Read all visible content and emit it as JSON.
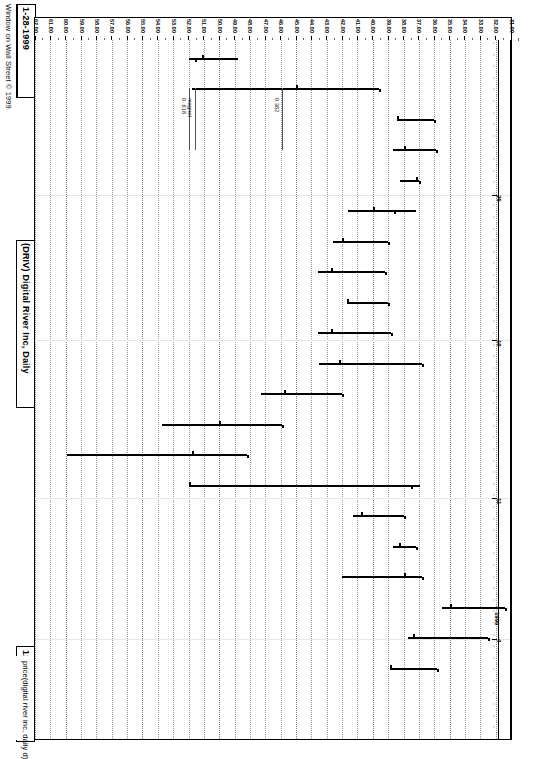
{
  "app": {
    "copyright": "Window on Wall Street © 1999",
    "title": "(DRIV)  Digital River Inc, Daily",
    "subtitle": "price(digital river inc, daily d)",
    "date_right": "1-28-1999",
    "date_left": "12-29-1998"
  },
  "annotations": [
    {
      "name": "fib-0618",
      "label": "0. 618",
      "price": 52.0
    },
    {
      "name": "magnet",
      "label": "magnet",
      "price": 51.6
    },
    {
      "name": "fib-0382",
      "label": "0.382",
      "price": 45.9
    }
  ],
  "date_axis": {
    "label_year": "1999",
    "ticks": [
      {
        "label": "25",
        "pos": 155
      },
      {
        "label": "19",
        "pos": 300
      },
      {
        "label": "11",
        "pos": 458
      },
      {
        "label": "4",
        "pos": 599
      }
    ]
  },
  "chart_data": {
    "type": "ohlc",
    "title": "(DRIV)  Digital River Inc, Daily",
    "subtitle": "price(digital river inc, daily d)",
    "xlabel": "price(digital river inc, daily d)",
    "ylabel": "",
    "orientation": "rotated-90",
    "value_axis": {
      "min": 31.0,
      "max": 62.0,
      "step": 1.0,
      "tick_labels": [
        "62.00",
        "61.00",
        "60.00",
        "59.00",
        "58.00",
        "57.00",
        "56.00",
        "55.00",
        "54.00",
        "53.00",
        "52.00",
        "51.00",
        "50.00",
        "49.00",
        "48.00",
        "47.00",
        "46.00",
        "45.00",
        "44.00",
        "43.00",
        "42.00",
        "41.00",
        "40.00",
        "39.00",
        "38.00",
        "37.00",
        "36.00",
        "35.00",
        "34.00",
        "33.00",
        "32.00",
        "31.00"
      ]
    },
    "date_range": {
      "start": "12-29-1998",
      "end": "1-28-1999"
    },
    "bars": [
      {
        "date": "1-28-1999",
        "open": 51.1,
        "high": 52.0,
        "low": 48.8,
        "close": 51.6
      },
      {
        "date": "1-27-1999",
        "open": 45.0,
        "high": 51.8,
        "low": 39.6,
        "close": 39.6
      },
      {
        "date": "1-26-1999",
        "open": 38.4,
        "high": 38.4,
        "low": 36.0,
        "close": 36.0
      },
      {
        "date": "1-25-1999",
        "open": 38.0,
        "high": 38.7,
        "low": 35.9,
        "close": 35.9
      },
      {
        "date": "1-22-1999",
        "open": 37.2,
        "high": 38.2,
        "low": 37.0,
        "close": 37.0
      },
      {
        "date": "1-21-1999",
        "open": 40.0,
        "high": 41.6,
        "low": 37.2,
        "close": 38.6
      },
      {
        "date": "1-20-1999",
        "open": 42.0,
        "high": 42.6,
        "low": 39.0,
        "close": 39.0
      },
      {
        "date": "1-19-1999",
        "open": 42.7,
        "high": 43.6,
        "low": 39.2,
        "close": 39.2
      },
      {
        "date": "1-15-1999",
        "open": 41.7,
        "high": 41.7,
        "low": 39.0,
        "close": 39.0
      },
      {
        "date": "1-14-1999",
        "open": 42.7,
        "high": 43.6,
        "low": 38.8,
        "close": 38.8
      },
      {
        "date": "1-13-1999",
        "open": 42.2,
        "high": 43.5,
        "low": 36.8,
        "close": 36.8
      },
      {
        "date": "1-12-1999",
        "open": 45.8,
        "high": 47.3,
        "low": 42.0,
        "close": 42.0
      },
      {
        "date": "1-11-1999",
        "open": 50.0,
        "high": 53.7,
        "low": 45.9,
        "close": 45.9
      },
      {
        "date": "1-08-1999",
        "open": 51.8,
        "high": 59.9,
        "low": 48.2,
        "close": 48.2
      },
      {
        "date": "1-07-1999",
        "open": 52.0,
        "high": 52.0,
        "low": 36.9,
        "close": 37.5
      },
      {
        "date": "1-06-1999",
        "open": 40.8,
        "high": 41.3,
        "low": 38.0,
        "close": 38.0
      },
      {
        "date": "1-05-1999",
        "open": 38.3,
        "high": 38.7,
        "low": 37.2,
        "close": 37.2
      },
      {
        "date": "1-04-1999",
        "open": 38.0,
        "high": 42.0,
        "low": 36.8,
        "close": 36.8
      },
      {
        "date": "12-31-1998",
        "open": 35.0,
        "high": 35.5,
        "low": 31.4,
        "close": 31.4
      },
      {
        "date": "12-30-1998",
        "open": 37.4,
        "high": 37.7,
        "low": 32.5,
        "close": 32.5
      },
      {
        "date": "12-29-1998",
        "open": 38.9,
        "high": 38.9,
        "low": 35.8,
        "close": 35.8
      }
    ]
  }
}
